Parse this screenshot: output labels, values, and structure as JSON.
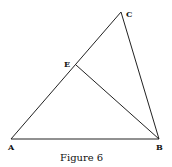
{
  "figure": {
    "caption": "Figure 6",
    "points": {
      "A": {
        "label": "A",
        "x": 11,
        "y": 139
      },
      "B": {
        "label": "B",
        "x": 159,
        "y": 139
      },
      "C": {
        "label": "C",
        "x": 121,
        "y": 12
      },
      "E": {
        "label": "E",
        "x": 76,
        "y": 65
      }
    },
    "segments": [
      [
        "A",
        "B"
      ],
      [
        "A",
        "C"
      ],
      [
        "B",
        "C"
      ],
      [
        "E",
        "B"
      ]
    ],
    "line_color": "#222222"
  }
}
